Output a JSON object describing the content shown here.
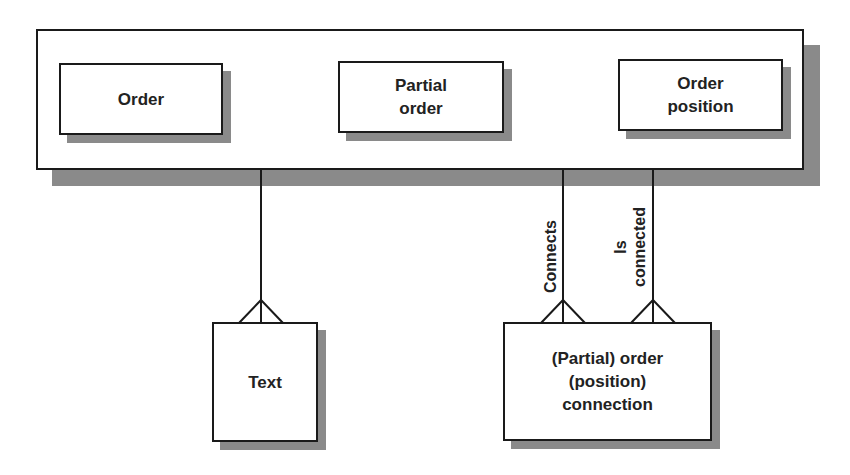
{
  "diagram": {
    "type": "entity-relationship",
    "container": {
      "entities": [
        {
          "id": "order",
          "label": "Order"
        },
        {
          "id": "partial_order",
          "label": "Partial order",
          "lines": [
            "Partial",
            "order"
          ]
        },
        {
          "id": "order_position",
          "label": "Order position",
          "lines": [
            "Order",
            "position"
          ]
        }
      ]
    },
    "entities": [
      {
        "id": "text",
        "label": "Text"
      },
      {
        "id": "connection",
        "label": "(Partial) order (position) connection",
        "lines": [
          "(Partial) order",
          "(position)",
          "connection"
        ]
      }
    ],
    "relationships": [
      {
        "from": "container",
        "to": "text",
        "label": "",
        "cardinality": "one-to-many"
      },
      {
        "from": "container",
        "to": "connection",
        "label": "Connects",
        "cardinality": "one-to-many"
      },
      {
        "from": "container",
        "to": "connection",
        "label": "Is connected",
        "lines": [
          "Is",
          "connected"
        ],
        "cardinality": "one-to-many"
      }
    ],
    "colors": {
      "stroke": "#1a1a1a",
      "shadow": "#8a8a8a",
      "fill": "#ffffff"
    }
  }
}
